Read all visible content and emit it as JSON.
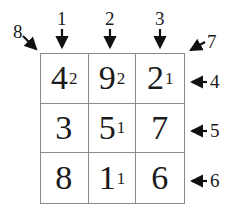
{
  "grid": {
    "rows": [
      [
        {
          "value": "4",
          "sub": "2"
        },
        {
          "value": "9",
          "sub": "2"
        },
        {
          "value": "2",
          "sub": "1"
        }
      ],
      [
        {
          "value": "3",
          "sub": ""
        },
        {
          "value": "5",
          "sub": "1"
        },
        {
          "value": "7",
          "sub": ""
        }
      ],
      [
        {
          "value": "8",
          "sub": ""
        },
        {
          "value": "1",
          "sub": "1"
        },
        {
          "value": "6",
          "sub": ""
        }
      ]
    ]
  },
  "labels": {
    "col1": "1",
    "col2": "2",
    "col3": "3",
    "row1": "4",
    "row2": "5",
    "row3": "6",
    "antidiag": "7",
    "diag": "8"
  }
}
